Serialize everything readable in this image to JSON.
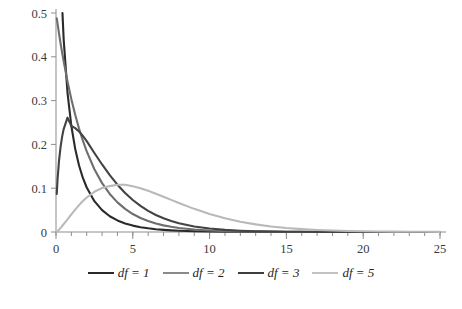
{
  "chart_data": {
    "type": "line",
    "title": "",
    "xlabel": "",
    "ylabel": "",
    "xlim": [
      0,
      25
    ],
    "ylim": [
      0,
      0.5
    ],
    "grid": false,
    "legend_position": "bottom",
    "xticks": [
      0,
      5,
      10,
      15,
      20,
      25
    ],
    "xtick_labels": [
      "0",
      "5",
      "10",
      "15",
      "20",
      "25"
    ],
    "x_minor_tick_step": 1,
    "yticks": [
      0,
      0.1,
      0.2,
      0.3,
      0.4,
      0.5
    ],
    "ytick_labels": [
      "0",
      "0.1",
      "0.2",
      "0.3",
      "0.4",
      "0.5"
    ],
    "x": [
      0.05,
      0.1,
      0.2,
      0.3,
      0.4,
      0.5,
      0.75,
      1,
      1.25,
      1.5,
      1.75,
      2,
      2.5,
      3,
      3.5,
      4,
      4.5,
      5,
      5.5,
      6,
      6.5,
      7,
      7.5,
      8,
      9,
      10,
      11,
      12,
      13,
      14,
      15,
      16,
      17,
      18,
      19,
      20,
      21,
      22,
      23,
      24,
      25
    ],
    "series": [
      {
        "name": "df = 1",
        "color": "#2a2a2a",
        "values": [
          1.7394,
          1.2001,
          0.8071,
          0.6268,
          0.516,
          0.4394,
          0.3178,
          0.242,
          0.1898,
          0.1519,
          0.1234,
          0.1016,
          0.0704,
          0.0499,
          0.036,
          0.0264,
          0.0195,
          0.0146,
          0.011,
          0.0084,
          0.0064,
          0.0049,
          0.0038,
          0.003,
          0.0018,
          0.0011,
          0.0007,
          0.0004,
          0.0002,
          0.0002,
          0.0001,
          0.0001,
          0.0,
          0.0,
          0.0,
          0.0,
          0.0,
          0.0,
          0.0,
          0.0,
          0.0
        ]
      },
      {
        "name": "df = 2",
        "color": "#6e6e6e",
        "values": [
          0.4877,
          0.4756,
          0.4524,
          0.4304,
          0.4094,
          0.3894,
          0.3436,
          0.3033,
          0.2676,
          0.2362,
          0.2084,
          0.1839,
          0.1433,
          0.1116,
          0.0869,
          0.0677,
          0.0527,
          0.041,
          0.032,
          0.0249,
          0.0194,
          0.0151,
          0.0118,
          0.0092,
          0.0056,
          0.0034,
          0.002,
          0.0012,
          0.0008,
          0.0005,
          0.0003,
          0.0002,
          0.0001,
          0.0001,
          0.0,
          0.0,
          0.0,
          0.0,
          0.0,
          0.0,
          0.0
        ]
      },
      {
        "name": "df = 3",
        "color": "#434343",
        "values": [
          0.0868,
          0.12,
          0.164,
          0.1948,
          0.2177,
          0.235,
          0.261,
          0.242,
          0.2372,
          0.2296,
          0.2193,
          0.2076,
          0.1804,
          0.1542,
          0.1297,
          0.108,
          0.0891,
          0.0731,
          0.0595,
          0.0482,
          0.0389,
          0.0313,
          0.0251,
          0.02,
          0.0127,
          0.008,
          0.0049,
          0.003,
          0.0018,
          0.0011,
          0.0007,
          0.0004,
          0.0002,
          0.0001,
          0.0001,
          0.0001,
          0.0,
          0.0,
          0.0,
          0.0,
          0.0
        ]
      },
      {
        "name": "df = 5",
        "color": "#b9b9b9",
        "values": [
          0.0007,
          0.002,
          0.0054,
          0.0094,
          0.0136,
          0.018,
          0.029,
          0.0403,
          0.0512,
          0.0613,
          0.0706,
          0.0788,
          0.0918,
          0.1004,
          0.1048,
          0.108,
          0.1078,
          0.1044,
          0.0999,
          0.094,
          0.0874,
          0.0804,
          0.0733,
          0.0662,
          0.0528,
          0.041,
          0.0313,
          0.0235,
          0.0174,
          0.0127,
          0.0092,
          0.0066,
          0.0047,
          0.0033,
          0.0023,
          0.0016,
          0.0011,
          0.0008,
          0.0005,
          0.0004,
          0.0003
        ]
      }
    ]
  },
  "legend": {
    "entries": [
      {
        "label": "df = 1",
        "color": "#2a2a2a"
      },
      {
        "label": "df = 2",
        "color": "#8a8a8a"
      },
      {
        "label": "df = 3",
        "color": "#3d3d3d"
      },
      {
        "label": "df = 5",
        "color": "#c2c2c2"
      }
    ]
  },
  "axis_style": {
    "axis_color": "#8d8d8d",
    "tick_label_color": "#3a3a3a"
  },
  "caption": {
    "text": ""
  }
}
